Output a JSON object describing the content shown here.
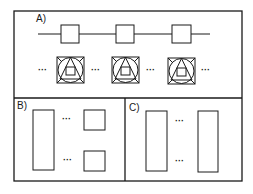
{
  "panels": {
    "a": {
      "label": "A)"
    },
    "b": {
      "label": "B)"
    },
    "c": {
      "label": "C)"
    }
  },
  "ellipsis": "···",
  "colors": {
    "stroke": "#1a1a1a",
    "background": "#ffffff"
  }
}
